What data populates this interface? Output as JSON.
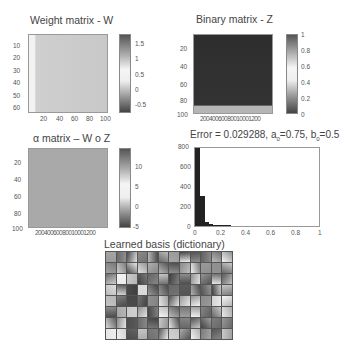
{
  "chart_data": [
    {
      "type": "heatmap",
      "title": "Weight matrix - W",
      "xlabel": "",
      "ylabel": "",
      "xticks": [
        "20",
        "40",
        "60",
        "80",
        "100"
      ],
      "yticks": [
        "10",
        "20",
        "30",
        "40",
        "50",
        "60"
      ],
      "xlim": [
        0,
        100
      ],
      "ylim": [
        64,
        0
      ],
      "colorbar": {
        "ticks": [
          "1.5",
          "1",
          "0.5",
          "0",
          "-0.5"
        ],
        "range": [
          -0.8,
          1.8
        ]
      },
      "colormap": "gray"
    },
    {
      "type": "heatmap",
      "title": "Binary matrix - Z",
      "xlabel": "",
      "ylabel": "",
      "xticks": [
        "200",
        "400",
        "600",
        "800",
        "1000",
        "1200"
      ],
      "yticks": [
        "20",
        "40",
        "60",
        "80",
        "100"
      ],
      "xlim": [
        0,
        1200
      ],
      "ylim": [
        100,
        0
      ],
      "colorbar": {
        "ticks": [
          "1",
          "0.8",
          "0.6",
          "0.4",
          "0.2",
          "0"
        ],
        "range": [
          0,
          1
        ]
      },
      "colormap": "gray"
    },
    {
      "type": "heatmap",
      "title": "α matrix – W o Z",
      "xlabel": "",
      "ylabel": "",
      "xticks": [
        "200",
        "400",
        "600",
        "800",
        "1000",
        "1200"
      ],
      "yticks": [
        "20",
        "40",
        "60",
        "80",
        "100"
      ],
      "xlim": [
        0,
        1200
      ],
      "ylim": [
        100,
        0
      ],
      "colorbar": {
        "ticks": [
          "10",
          "5",
          "0",
          "-5"
        ],
        "range": [
          -6,
          14
        ]
      },
      "colormap": "gray"
    },
    {
      "type": "bar",
      "title": "Error = 0.029288, a0=0.75, b0=0.5",
      "title_parts": {
        "prefix": "Error = 0.029288, a",
        "sub1": "0",
        "mid": "=0.75, b",
        "sub2": "0",
        "suffix": "=0.5"
      },
      "xlabel": "",
      "ylabel": "",
      "xticks": [
        "0",
        "0.2",
        "0.4",
        "0.6",
        "0.8",
        "1"
      ],
      "yticks": [
        "800",
        "600",
        "400",
        "200",
        "0"
      ],
      "xlim": [
        0,
        1
      ],
      "ylim": [
        0,
        800
      ],
      "categories": [
        "0.0125",
        "0.0375",
        "0.0625",
        "0.0875",
        "0.1125",
        "0.1375",
        "0.1625",
        "0.1875",
        "0.2125",
        "0.2375",
        "0.2625",
        "0.2875"
      ],
      "values": [
        800,
        300,
        40,
        22,
        12,
        6,
        4,
        3,
        2,
        2,
        1,
        1
      ]
    },
    {
      "type": "heatmap",
      "title": "Learned basis (dictionary)",
      "grid": {
        "rows": 8,
        "cols": 12
      },
      "colormap": "gray"
    }
  ]
}
